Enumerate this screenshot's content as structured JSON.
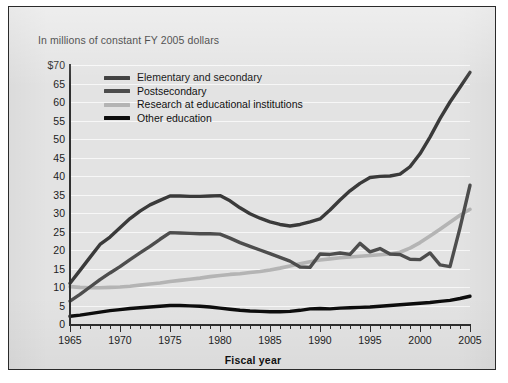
{
  "figure": {
    "subtitle": "In millions of constant FY 2005 dollars",
    "xaxis_title": "Fiscal year",
    "background_color": "#e3e3e3",
    "border_color": "#2a2a2a",
    "gridline_color": "#f7f7f7"
  },
  "legend": {
    "position": "inside-top-left",
    "items": [
      {
        "label": "Elementary and secondary",
        "color": "#3a3a3a"
      },
      {
        "label": "Postsecondary",
        "color": "#4d4d4d"
      },
      {
        "label": "Research at educational institutions",
        "color": "#b4b4b4"
      },
      {
        "label": "Other education",
        "color": "#0d0d0d"
      }
    ]
  },
  "chart_data": {
    "type": "line",
    "title": "",
    "subtitle": "In millions of constant FY 2005 dollars",
    "xlabel": "Fiscal year",
    "ylabel": "",
    "xlim": [
      1965,
      2005
    ],
    "ylim": [
      0,
      70
    ],
    "grid": true,
    "legend_position": "inside-top-left",
    "ytick_labels": [
      "0",
      "5",
      "10",
      "15",
      "20",
      "25",
      "30",
      "35",
      "40",
      "45",
      "50",
      "55",
      "60",
      "65",
      "$70"
    ],
    "ytick_values": [
      0,
      5,
      10,
      15,
      20,
      25,
      30,
      35,
      40,
      45,
      50,
      55,
      60,
      65,
      70
    ],
    "xtick_labels": [
      "1965",
      "1970",
      "1975",
      "1980",
      "1985",
      "1990",
      "1995",
      "2000",
      "2005"
    ],
    "xtick_values": [
      1965,
      1970,
      1975,
      1980,
      1985,
      1990,
      1995,
      2000,
      2005
    ],
    "x": [
      1965,
      1966,
      1967,
      1968,
      1969,
      1970,
      1971,
      1972,
      1973,
      1974,
      1975,
      1976,
      1977,
      1978,
      1979,
      1980,
      1981,
      1982,
      1983,
      1984,
      1985,
      1986,
      1987,
      1988,
      1989,
      1990,
      1991,
      1992,
      1993,
      1994,
      1995,
      1996,
      1997,
      1998,
      1999,
      2000,
      2001,
      2002,
      2003,
      2004,
      2005
    ],
    "series": [
      {
        "name": "Elementary and secondary",
        "color": "#3a3a3a",
        "values": [
          11.0,
          14.5,
          18.0,
          21.5,
          23.5,
          26.0,
          28.5,
          30.5,
          32.2,
          33.4,
          34.6,
          34.6,
          34.5,
          34.5,
          34.6,
          34.7,
          33.3,
          31.4,
          29.8,
          28.6,
          27.6,
          26.9,
          26.5,
          26.9,
          27.6,
          28.4,
          30.8,
          33.5,
          36.0,
          38.0,
          39.6,
          39.9,
          40.0,
          40.5,
          42.5,
          46.0,
          50.5,
          55.5,
          60.0,
          64.0,
          68.0
        ]
      },
      {
        "name": "Postsecondary",
        "color": "#4d4d4d",
        "values": [
          6.2,
          8.0,
          10.0,
          12.0,
          13.8,
          15.5,
          17.4,
          19.2,
          21.0,
          22.9,
          24.7,
          24.6,
          24.5,
          24.4,
          24.4,
          24.3,
          23.2,
          22.0,
          21.0,
          20.0,
          19.0,
          18.0,
          17.0,
          15.4,
          15.3,
          18.9,
          18.8,
          19.2,
          18.8,
          21.8,
          19.5,
          20.4,
          18.9,
          18.8,
          17.5,
          17.4,
          19.2,
          16.0,
          15.5,
          26.0,
          37.5
        ]
      },
      {
        "name": "Research at educational institutions",
        "color": "#b4b4b4",
        "values": [
          10.1,
          9.9,
          9.8,
          9.8,
          9.9,
          10.0,
          10.2,
          10.5,
          10.8,
          11.1,
          11.5,
          11.8,
          12.1,
          12.4,
          12.8,
          13.1,
          13.4,
          13.6,
          13.9,
          14.2,
          14.6,
          15.1,
          15.7,
          16.3,
          16.8,
          17.3,
          17.6,
          17.9,
          18.1,
          18.3,
          18.5,
          18.7,
          18.9,
          19.4,
          20.5,
          22.0,
          23.8,
          25.6,
          27.5,
          29.4,
          31.0
        ]
      },
      {
        "name": "Other education",
        "color": "#0d0d0d",
        "values": [
          2.1,
          2.4,
          2.8,
          3.2,
          3.6,
          3.9,
          4.2,
          4.4,
          4.6,
          4.8,
          5.0,
          5.0,
          4.9,
          4.8,
          4.6,
          4.3,
          4.0,
          3.7,
          3.5,
          3.4,
          3.3,
          3.3,
          3.4,
          3.7,
          4.1,
          4.2,
          4.1,
          4.3,
          4.4,
          4.5,
          4.6,
          4.8,
          5.0,
          5.2,
          5.4,
          5.6,
          5.8,
          6.1,
          6.4,
          6.9,
          7.5
        ]
      }
    ]
  }
}
